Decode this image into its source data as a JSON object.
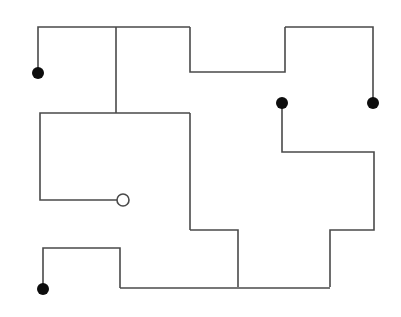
{
  "figure": {
    "width": 401,
    "height": 317,
    "background_color": "#ffffff",
    "line_color": "#4a4a4a",
    "line_width": 1.6,
    "terminal_fill_color": "#0d0d0d",
    "terminal_open_fill_color": "#ffffff",
    "terminal_open_stroke_color": "#4a4a4a",
    "terminal_filled_radius": 6,
    "terminal_open_radius": 6,
    "terminal_open_stroke_width": 1.6
  },
  "paths": [
    {
      "name": "path-top-left-branch",
      "points": "38,73 38,27 190,27"
    },
    {
      "name": "path-top-u-dip",
      "points": "190,27 190,72 285,72 285,27"
    },
    {
      "name": "path-top-right-branch",
      "points": "285,27 373,27 373,103"
    },
    {
      "name": "path-center-vertical-spur",
      "points": "116,27 116,113"
    },
    {
      "name": "path-left-room-outline",
      "points": "190,113 40,113 40,200 123,200"
    },
    {
      "name": "path-center-right-vertical",
      "points": "190,113 190,230"
    },
    {
      "name": "path-center-step-down",
      "points": "190,230 238,230 238,287"
    },
    {
      "name": "path-right-mid-branch",
      "points": "282,103 282,152 374,152 374,230 330,230 330,287"
    },
    {
      "name": "path-bottom-left-branch",
      "points": "43,288 43,248 120,248 120,288"
    },
    {
      "name": "path-bottom-horizontal",
      "points": "120,288 330,288"
    }
  ],
  "terminals": [
    {
      "name": "terminal-dot-top-left",
      "type": "filled",
      "cx": 38,
      "cy": 73
    },
    {
      "name": "terminal-dot-mid-right",
      "type": "filled",
      "cx": 282,
      "cy": 103
    },
    {
      "name": "terminal-dot-far-right",
      "type": "filled",
      "cx": 373,
      "cy": 103
    },
    {
      "name": "terminal-dot-bottom-left",
      "type": "filled",
      "cx": 43,
      "cy": 289
    },
    {
      "name": "terminal-circle-open-center",
      "type": "open",
      "cx": 123,
      "cy": 200
    }
  ]
}
